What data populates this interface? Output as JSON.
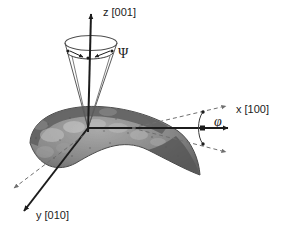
{
  "figure": {
    "background_color": "#ffffff",
    "width": 287,
    "height": 229
  },
  "axes": [
    {
      "id": "z",
      "label": "z [001]",
      "direction": "up",
      "color": "#1c1c1c",
      "label_x": 103,
      "label_y": 16
    },
    {
      "id": "x",
      "label": "x [100]",
      "direction": "right",
      "color": "#1c1c1c",
      "label_x": 236,
      "label_y": 113
    },
    {
      "id": "y",
      "label": "y [010]",
      "direction": "down-left",
      "color": "#1c1c1c",
      "label_x": 36,
      "label_y": 219
    }
  ],
  "angles": [
    {
      "id": "psi",
      "symbol": "Ψ",
      "description": "Cone half-angle about the z [001] axis",
      "label_x": 118,
      "label_y": 58
    },
    {
      "id": "phi",
      "symbol": "φ",
      "description": "In-plane angular deviation about the x [100] axis",
      "label_x": 217,
      "label_y": 124
    }
  ],
  "geometry": {
    "origin": {
      "x": 88,
      "y": 128
    },
    "cone": {
      "apex": {
        "x": 88,
        "y": 128
      },
      "ellipse_cx": 91,
      "ellipse_cy": 43,
      "ellipse_rx": 26,
      "ellipse_ry": 7,
      "inner_ellipse_cy": 56,
      "inner_ellipse_rx": 22,
      "inner_ellipse_ry": 6
    },
    "blade": {
      "description": "Shaded grayscale turbine blade airfoil with mottled surface texture",
      "fill_dark": "#6e6e6e",
      "fill_mid": "#8f8f8f",
      "fill_light": "#b8b8b8",
      "outline": "#4a4a4a"
    }
  },
  "colors": {
    "axis": "#1c1c1c",
    "dashed_guide": "#6f6f6f",
    "cone_outline": "#5a5a5a",
    "text": "#1c1c1c"
  }
}
